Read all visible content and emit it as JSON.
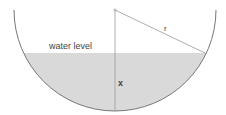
{
  "diagram": {
    "type": "hemispherical-bowl",
    "labels": {
      "water_level": "water level",
      "radius": "r",
      "depth": "x"
    },
    "colors": {
      "water": "#d9d9d9",
      "outline": "#777777",
      "text": "#444444"
    },
    "geometry": {
      "center": [
        115,
        10
      ],
      "radius": 101,
      "water_y": 53
    }
  }
}
